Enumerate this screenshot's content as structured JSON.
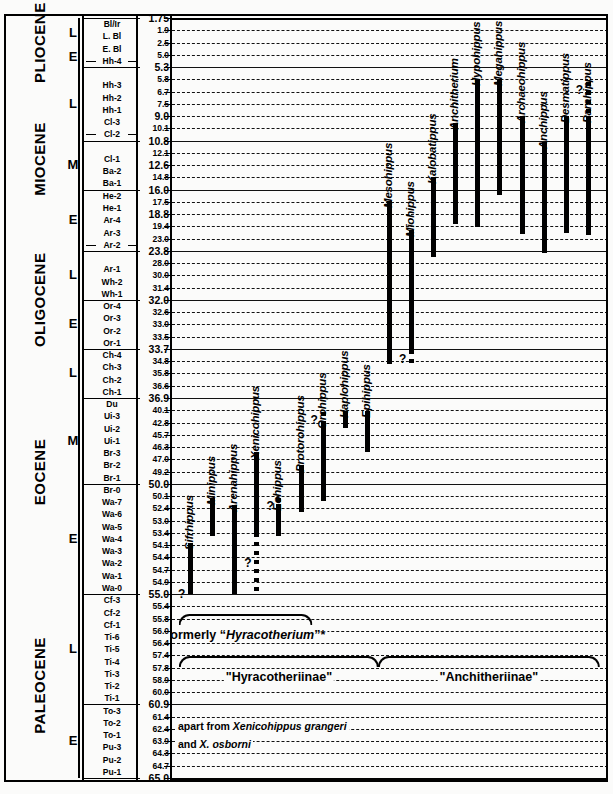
{
  "chart_data": {
    "type": "range_chart",
    "ylabel": "Age (Ma)",
    "ylim": [
      1.75,
      65.0
    ],
    "axis_direction": "inverted (youngest at top)",
    "grid": "horizontal dashed lines at every NALMA zone boundary",
    "epochs": [
      {
        "name": "PLIOCENE",
        "top_ma": 1.75,
        "bottom_ma": 5.3
      },
      {
        "name": "MIOCENE",
        "top_ma": 5.3,
        "bottom_ma": 23.8
      },
      {
        "name": "OLIGOCENE",
        "top_ma": 23.8,
        "bottom_ma": 33.7
      },
      {
        "name": "EOCENE",
        "top_ma": 33.7,
        "bottom_ma": 55.0
      },
      {
        "name": "PALEOCENE",
        "top_ma": 55.0,
        "bottom_ma": 65.0
      }
    ],
    "subepochs": [
      {
        "label": "L",
        "top_ma": 1.75,
        "bottom_ma": 3.6
      },
      {
        "label": "E",
        "top_ma": 3.6,
        "bottom_ma": 5.3
      },
      {
        "label": "L",
        "top_ma": 5.3,
        "bottom_ma": 10.8
      },
      {
        "label": "M",
        "top_ma": 10.8,
        "bottom_ma": 16.0
      },
      {
        "label": "E",
        "top_ma": 16.0,
        "bottom_ma": 23.8
      },
      {
        "label": "L",
        "top_ma": 23.8,
        "bottom_ma": 32.0
      },
      {
        "label": "E",
        "top_ma": 32.0,
        "bottom_ma": 33.7
      },
      {
        "label": "L",
        "top_ma": 33.7,
        "bottom_ma": 36.9
      },
      {
        "label": "M",
        "top_ma": 36.9,
        "bottom_ma": 50.0
      },
      {
        "label": "E",
        "top_ma": 50.0,
        "bottom_ma": 55.0
      },
      {
        "label": "L",
        "top_ma": 55.0,
        "bottom_ma": 60.9
      },
      {
        "label": "E",
        "top_ma": 60.9,
        "bottom_ma": 65.0
      }
    ],
    "zones": [
      {
        "name": "Bl/Ir",
        "age": "1.75",
        "major": true,
        "boundary": "thick"
      },
      {
        "name": "L. Bl",
        "age": "1.9"
      },
      {
        "name": "E. Bl",
        "age": "2.5"
      },
      {
        "name": "Hh-4",
        "age": "5.0",
        "subdiv": true
      },
      {
        "name": "",
        "age": "5.3",
        "major": true,
        "boundary": "solid"
      },
      {
        "name": "Hh-3",
        "age": "5.8"
      },
      {
        "name": "Hh-2",
        "age": "6.7"
      },
      {
        "name": "Hh-1",
        "age": "7.5"
      },
      {
        "name": "Cl-3",
        "age": "9.0",
        "major": true
      },
      {
        "name": "Cl-2",
        "age": "10.1",
        "subdiv": true
      },
      {
        "name": "",
        "age": "10.8",
        "major": true,
        "boundary": "solid"
      },
      {
        "name": "Cl-1",
        "age": "12.1"
      },
      {
        "name": "Ba-2",
        "age": "12.6",
        "major": true
      },
      {
        "name": "Ba-1",
        "age": "14.8"
      },
      {
        "name": "He-2",
        "age": "16.0",
        "major": true,
        "boundary": "solid"
      },
      {
        "name": "He-1",
        "age": "17.5"
      },
      {
        "name": "Ar-4",
        "age": "18.8",
        "major": true
      },
      {
        "name": "Ar-3",
        "age": "19.4"
      },
      {
        "name": "Ar-2",
        "age": "23.0",
        "subdiv": true
      },
      {
        "name": "",
        "age": "23.8",
        "major": true,
        "boundary": "solid"
      },
      {
        "name": "Ar-1",
        "age": "28.0"
      },
      {
        "name": "Wh-2",
        "age": "30.0"
      },
      {
        "name": "Wh-1",
        "age": "31.4"
      },
      {
        "name": "Or-4",
        "age": "32.0",
        "major": true,
        "boundary": "solid"
      },
      {
        "name": "Or-3",
        "age": "32.6"
      },
      {
        "name": "Or-2",
        "age": "33.0"
      },
      {
        "name": "Or-1",
        "age": "33.5"
      },
      {
        "name": "Ch-4",
        "age": "33.7",
        "major": true,
        "boundary": "solid"
      },
      {
        "name": "Ch-3",
        "age": "34.8"
      },
      {
        "name": "Ch-2",
        "age": "35.8"
      },
      {
        "name": "Ch-1",
        "age": "36.6"
      },
      {
        "name": "Du",
        "age": "36.9",
        "major": true,
        "boundary": "solid"
      },
      {
        "name": "Ui-3",
        "age": "40.1"
      },
      {
        "name": "Ui-2",
        "age": "42.8"
      },
      {
        "name": "Ui-1",
        "age": "45.7"
      },
      {
        "name": "Br-3",
        "age": "46.3"
      },
      {
        "name": "Br-2",
        "age": "47.0"
      },
      {
        "name": "Br-1",
        "age": "49.2"
      },
      {
        "name": "Br-0",
        "age": "50.0",
        "major": true,
        "boundary": "solid"
      },
      {
        "name": "Wa-7",
        "age": "50.1"
      },
      {
        "name": "Wa-6",
        "age": "52.4"
      },
      {
        "name": "Wa-5",
        "age": "53.0"
      },
      {
        "name": "Wa-4",
        "age": "53.4"
      },
      {
        "name": "Wa-3",
        "age": "54.1"
      },
      {
        "name": "Wa-2",
        "age": "54.4"
      },
      {
        "name": "Wa-1",
        "age": "54.7"
      },
      {
        "name": "Wa-0",
        "age": "54.9"
      },
      {
        "name": "Cf-3",
        "age": "55.0",
        "major": true,
        "boundary": "solid"
      },
      {
        "name": "Cf-2",
        "age": "55.4"
      },
      {
        "name": "Cf-1",
        "age": "55.8"
      },
      {
        "name": "Ti-6",
        "age": "56.0"
      },
      {
        "name": "Ti-5",
        "age": "56.4"
      },
      {
        "name": "Ti-4",
        "age": "57.4"
      },
      {
        "name": "Ti-3",
        "age": "57.8"
      },
      {
        "name": "Ti-2",
        "age": "58.9"
      },
      {
        "name": "Ti-1",
        "age": "60.0"
      },
      {
        "name": "To-3",
        "age": "60.9",
        "major": true,
        "boundary": "solid"
      },
      {
        "name": "To-2",
        "age": "61.4"
      },
      {
        "name": "To-1",
        "age": "62.4"
      },
      {
        "name": "Pu-3",
        "age": "63.9"
      },
      {
        "name": "Pu-2",
        "age": "64.3"
      },
      {
        "name": "Pu-1",
        "age": "64.7"
      },
      {
        "name": "",
        "age": "65.0",
        "major": true,
        "boundary": "thick"
      }
    ],
    "genera": [
      {
        "name": "Sifrhippus",
        "top_ma": 54.0,
        "bottom_ma": 55.0,
        "uncertain_top_ma": null,
        "uncertain_bottom_ma": 55.0,
        "query": true,
        "query_side": "left"
      },
      {
        "name": "Minippus",
        "top_ma": 50.5,
        "bottom_ma": 53.6,
        "query": false
      },
      {
        "name": "Arenahippus",
        "top_ma": 51.8,
        "bottom_ma": 55.0,
        "uncertain_bottom_ma": 55.0,
        "query": false
      },
      {
        "name": "Xenicohippus",
        "top_ma": 46.6,
        "bottom_ma": 53.4,
        "uncertain_bottom_ma": 55.0,
        "query": true,
        "query_side": "left"
      },
      {
        "name": "Eohippus",
        "top_ma": 51.6,
        "bottom_ma": 53.6,
        "uncertain_top_ma": 50.4,
        "query": true,
        "query_side": "left"
      },
      {
        "name": "Protorohippus",
        "top_ma": 48.0,
        "bottom_ma": 52.6,
        "query": false
      },
      {
        "name": "Orohippus",
        "top_ma": 42.6,
        "bottom_ma": 51.0,
        "uncertain_top_ma": 40.4,
        "query": true,
        "query_side": "left"
      },
      {
        "name": "Haplohippus",
        "top_ma": 40.2,
        "bottom_ma": 44.2,
        "query": false
      },
      {
        "name": "Epihippus",
        "top_ma": 40.2,
        "bottom_ma": 46.6,
        "query": false
      },
      {
        "name": "Mesohippus",
        "top_ma": 17.4,
        "bottom_ma": 35.0,
        "query": false
      },
      {
        "name": "Miohippus",
        "top_ma": 20.5,
        "bottom_ma": 33.8,
        "uncertain_bottom_ma": 35.3,
        "query": true,
        "query_side": "left"
      },
      {
        "name": "Kalobatippus",
        "top_ma": 14.8,
        "bottom_ma": 25.9,
        "query": false
      },
      {
        "name": "Anchitherium",
        "top_ma": 9.6,
        "bottom_ma": 19.3,
        "query": false
      },
      {
        "name": "Hypohippus",
        "top_ma": 5.8,
        "bottom_ma": 19.6,
        "query": false
      },
      {
        "name": "Megahippus",
        "top_ma": 5.8,
        "bottom_ma": 16.6,
        "query": false
      },
      {
        "name": "Archaeohippus",
        "top_ma": 9.0,
        "bottom_ma": 21.5,
        "query": false
      },
      {
        "name": "Anchippus",
        "top_ma": 10.9,
        "bottom_ma": 24.4,
        "query": false
      },
      {
        "name": "Desmatippus",
        "top_ma": 9.0,
        "bottom_ma": 21.4,
        "query": false
      },
      {
        "name": "Parahippus",
        "top_ma": 9.0,
        "bottom_ma": 21.9,
        "uncertain_top_ma": 6.0,
        "query": true,
        "query_side": "left"
      }
    ],
    "brackets": [
      {
        "label": "formerly \"Hyracotherium\"*",
        "from_genus": "Sifrhippus",
        "to_genus": "Protorohippus"
      },
      {
        "label": "\"Hyracotheriinae\"",
        "from_genus": "Sifrhippus",
        "to_genus": "Epihippus"
      },
      {
        "label": "\"Anchitheriinae\"",
        "from_genus": "Mesohippus",
        "to_genus": "Parahippus"
      }
    ],
    "footnotes": [
      "apart from Xenicohippus grangeri",
      "and X. osborni"
    ]
  },
  "epoch_labels": {
    "pliocene": "PLIOCENE",
    "miocene": "MIOCENE",
    "oligocene": "OLIGOCENE",
    "eocene": "EOCENE",
    "paleocene": "PALEOCENE"
  },
  "captions": {
    "formerly": "formerly ",
    "formerly_italic": "Hyracotherium",
    "formerly_suffix": "”*",
    "formerly_open": "“",
    "hyracotheriinae": "“Hyracotheriinae”",
    "anchitheriinae": "“Anchitheriinae”"
  },
  "notes": {
    "line1_prefix": "apart from ",
    "line1_italic": "Xenicohippus grangeri",
    "line2_italic": "X. osborni",
    "line2_prefix": "and "
  }
}
